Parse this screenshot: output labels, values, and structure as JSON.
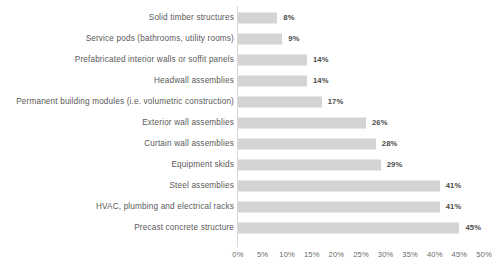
{
  "chart_data": {
    "type": "bar",
    "orientation": "horizontal",
    "title": "",
    "subtitle": "",
    "xlabel": "",
    "ylabel": "",
    "xlim": [
      0,
      50
    ],
    "xtick_step": 5,
    "grid": false,
    "legend": null,
    "value_suffix": "%",
    "bar_color": "#d4d4d4",
    "axis_color": "#d9d9d9",
    "label_color": "#595959",
    "value_label_color": "#4a4a4a",
    "categories": [
      "Solid timber structures",
      "Service pods (bathrooms, utility rooms)",
      "Prefabricated interior walls or soffit panels",
      "Headwall assemblies",
      "Permanent building modules (i.e. volumetric construction)",
      "Exterior wall assemblies",
      "Curtain wall assemblies",
      "Equipment skids",
      "Steel assemblies",
      "HVAC, plumbing and electrical racks",
      "Precast concrete structure"
    ],
    "values": [
      8,
      9,
      14,
      14,
      17,
      26,
      28,
      29,
      41,
      41,
      45
    ],
    "value_labels": [
      "8%",
      "9%",
      "14%",
      "14%",
      "17%",
      "26%",
      "28%",
      "29%",
      "41%",
      "41%",
      "45%"
    ],
    "xticks": [
      0,
      5,
      10,
      15,
      20,
      25,
      30,
      35,
      40,
      45,
      50
    ],
    "xtick_labels": [
      "0%",
      "5%",
      "10%",
      "15%",
      "20%",
      "25%",
      "30%",
      "35%",
      "40%",
      "45%",
      "50%"
    ]
  }
}
